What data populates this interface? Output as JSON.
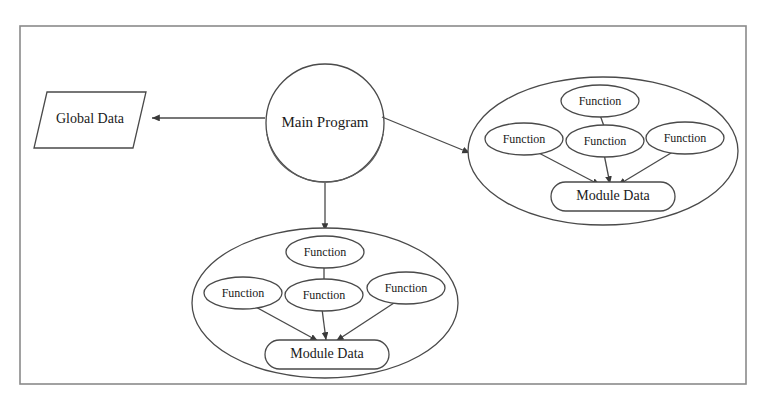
{
  "diagram": {
    "frame": {
      "x": 20,
      "y": 26,
      "width": 726,
      "height": 358,
      "border_color": "#8a8a8a"
    },
    "palette": {
      "background": "#ffffff",
      "stroke": "#4a4a4a",
      "text": "#1a1a1a",
      "frame": "#8a8a8a"
    },
    "nodes": {
      "global_data": {
        "label": "Global Data",
        "shape": "parallelogram",
        "cx": 90,
        "cy": 119
      },
      "main_program": {
        "label": "Main Program",
        "shape": "cylinder",
        "cx": 325,
        "cy": 123
      },
      "module_right": {
        "container_shape": "ellipse",
        "cx": 603,
        "cy": 151,
        "data_node": {
          "label": "Module Data",
          "shape": "stadium",
          "cx": 613,
          "cy": 196
        },
        "functions": [
          {
            "label": "Function",
            "position": "top",
            "cx": 600,
            "cy": 101
          },
          {
            "label": "Function",
            "position": "left",
            "cx": 524,
            "cy": 139
          },
          {
            "label": "Function",
            "position": "center",
            "cx": 605,
            "cy": 141
          },
          {
            "label": "Function",
            "position": "right",
            "cx": 685,
            "cy": 138
          }
        ]
      },
      "module_bottom": {
        "container_shape": "ellipse",
        "cx": 325,
        "cy": 303,
        "data_node": {
          "label": "Module Data",
          "shape": "stadium",
          "cx": 327,
          "cy": 354
        },
        "functions": [
          {
            "label": "Function",
            "position": "top",
            "cx": 325,
            "cy": 252
          },
          {
            "label": "Function",
            "position": "left",
            "cx": 243,
            "cy": 293
          },
          {
            "label": "Function",
            "position": "center",
            "cx": 324,
            "cy": 295
          },
          {
            "label": "Function",
            "position": "right",
            "cx": 406,
            "cy": 288
          }
        ]
      }
    },
    "edges": [
      {
        "name": "main-to-global",
        "from": "main_program",
        "to": "global_data",
        "arrow": "end"
      },
      {
        "name": "main-to-module-right",
        "from": "main_program",
        "to": "module_right",
        "arrow": "end"
      },
      {
        "name": "main-to-module-bottom",
        "from": "main_program",
        "to": "module_bottom",
        "arrow": "end"
      },
      {
        "name": "right-fn-top-to-center",
        "from": "function-top",
        "to": "function-center",
        "arrow": "none"
      },
      {
        "name": "right-fn-left-to-data",
        "from": "function-left",
        "to": "module-data",
        "arrow": "end"
      },
      {
        "name": "right-fn-center-to-data",
        "from": "function-center",
        "to": "module-data",
        "arrow": "end"
      },
      {
        "name": "right-fn-right-to-data",
        "from": "function-right",
        "to": "module-data",
        "arrow": "end"
      },
      {
        "name": "bottom-fn-top-to-center",
        "from": "function-top",
        "to": "function-center",
        "arrow": "none"
      },
      {
        "name": "bottom-fn-left-to-data",
        "from": "function-left",
        "to": "module-data",
        "arrow": "end"
      },
      {
        "name": "bottom-fn-center-to-data",
        "from": "function-center",
        "to": "module-data",
        "arrow": "end"
      },
      {
        "name": "bottom-fn-right-to-data",
        "from": "function-right",
        "to": "module-data",
        "arrow": "end"
      }
    ]
  }
}
